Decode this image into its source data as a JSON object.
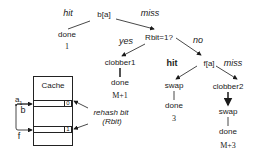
{
  "tree": {
    "root": {
      "label": "b[a]"
    },
    "root_hit_edge": "hit",
    "root_miss_edge": "miss",
    "hit_result": {
      "label": "done",
      "cost": "1"
    },
    "rbit_test": {
      "label": "Rbit=1?"
    },
    "yes_edge": "yes",
    "no_edge": "no",
    "yes_branch": {
      "action": "clobber1",
      "result": "done",
      "cost": "M+1"
    },
    "f_probe": {
      "label": "f[a]"
    },
    "f_hit_edge": "hit",
    "f_miss_edge": "miss",
    "f_hit_branch": {
      "action": "swap",
      "result": "done",
      "cost": "3"
    },
    "f_miss_branch": {
      "action1": "clobber2",
      "action2": "swap",
      "result": "done",
      "cost": "M+3"
    }
  },
  "cache": {
    "title": "Cache",
    "rows": [
      {
        "bit": "0"
      },
      {
        "bit": "1"
      }
    ],
    "address_label": "a",
    "address_subscript": "1",
    "b_label": "b",
    "f_label": "f",
    "annotation_line1": "rehash bit",
    "annotation_line2": "(Rbit)"
  }
}
